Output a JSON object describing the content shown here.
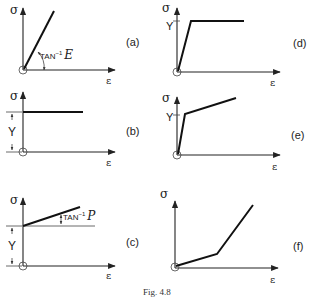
{
  "figure": {
    "caption": "Fig. 4.8",
    "axis_labels": {
      "y": "σ",
      "x": "ε"
    },
    "panels": [
      {
        "id": "a",
        "label": "(a)",
        "description": "Linear elastic",
        "annotation": "TAN",
        "annotation_sup": "−1",
        "annotation_var": "E"
      },
      {
        "id": "b",
        "label": "(b)",
        "description": "Rigid perfectly plastic",
        "yield_label": "Y"
      },
      {
        "id": "c",
        "label": "(c)",
        "description": "Rigid linear hardening",
        "yield_label": "Y",
        "annotation": "TAN",
        "annotation_sup": "−1",
        "annotation_var": "P"
      },
      {
        "id": "d",
        "label": "(d)",
        "description": "Elastic perfectly plastic",
        "yield_label": "Y"
      },
      {
        "id": "e",
        "label": "(e)",
        "description": "Elastic linear hardening",
        "yield_label": "Y"
      },
      {
        "id": "f",
        "label": "(f)",
        "description": "Bilinear stiffening"
      }
    ]
  }
}
